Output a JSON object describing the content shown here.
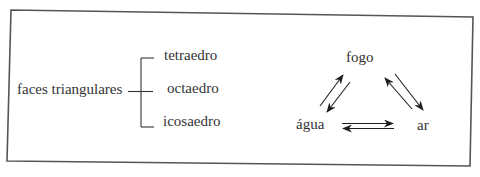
{
  "classification": {
    "root": "faces triangulares",
    "branches": [
      "tetraedro",
      "octaedro",
      "icosaedro"
    ]
  },
  "cycle": {
    "top": "fogo",
    "bottom_left": "água",
    "bottom_right": "ar",
    "arrows": [
      {
        "from": "água",
        "to": "fogo"
      },
      {
        "from": "fogo",
        "to": "água"
      },
      {
        "from": "fogo",
        "to": "ar"
      },
      {
        "from": "ar",
        "to": "fogo"
      },
      {
        "from": "água",
        "to": "ar"
      },
      {
        "from": "ar",
        "to": "água"
      }
    ]
  },
  "colors": {
    "ink": "#2a2a2a",
    "frame": "#555555",
    "background": "#ffffff"
  }
}
